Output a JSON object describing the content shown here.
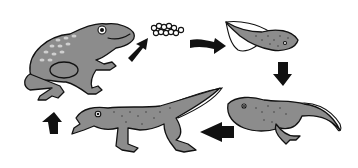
{
  "diagram": {
    "stages": [
      {
        "id": "adult-frog",
        "label": "Adult frog"
      },
      {
        "id": "eggs",
        "label": "Frog spawn (eggs)"
      },
      {
        "id": "tadpole",
        "label": "Tadpole"
      },
      {
        "id": "tadpole-with-legs",
        "label": "Tadpole with back legs"
      },
      {
        "id": "froglet",
        "label": "Froglet with tail"
      }
    ],
    "flow": [
      "adult-frog",
      "eggs",
      "tadpole",
      "tadpole-with-legs",
      "froglet",
      "adult-frog"
    ],
    "colors": {
      "body": "#8c8c8c",
      "outline": "#111111",
      "arrow": "#111111",
      "background": "#ffffff"
    }
  }
}
